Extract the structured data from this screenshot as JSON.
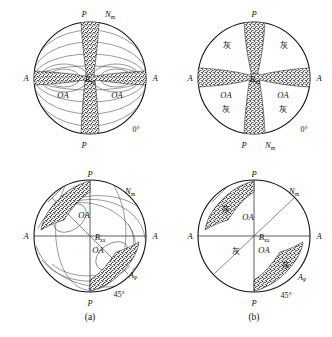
{
  "figure": {
    "captions": {
      "left": "(a)",
      "right": "(b)"
    }
  },
  "labels": {
    "P": "P",
    "A": "A",
    "OA": "OA",
    "Bxa_main": "B",
    "Bxa_sub": "xa",
    "Nm_main": "N",
    "Nm_sub": "m",
    "Ap_main": "A",
    "Ap_sub": "P",
    "gray_cjk": "灰",
    "angle_0": "0°",
    "angle_45": "45°"
  },
  "colors": {
    "outline": "#111111",
    "isochrome": "#555555",
    "brush": "#1a1a1a",
    "background": "#ffffff"
  },
  "panels": [
    {
      "id": "top-left",
      "name": "panel-a-0deg",
      "column": "a",
      "orientation": "0°",
      "has_isochromes": true,
      "has_gray_labels": false,
      "labels_shown": [
        "P",
        "N_m",
        "A",
        "A",
        "B_xa",
        "OA",
        "OA",
        "P",
        "0°"
      ]
    },
    {
      "id": "top-right",
      "name": "panel-b-0deg",
      "column": "b",
      "orientation": "0°",
      "has_isochromes": false,
      "has_gray_labels": true,
      "labels_shown": [
        "P",
        "A",
        "A",
        "B_xa",
        "OA",
        "OA",
        "灰",
        "灰",
        "灰",
        "灰",
        "P",
        "N_m",
        "0°"
      ]
    },
    {
      "id": "bottom-left",
      "name": "panel-a-45deg",
      "column": "a",
      "orientation": "45°",
      "has_isochromes": true,
      "has_gray_labels": false,
      "labels_shown": [
        "P",
        "N_m",
        "A",
        "A",
        "B_xa",
        "OA",
        "OA",
        "A_P",
        "P",
        "45°"
      ]
    },
    {
      "id": "bottom-right",
      "name": "panel-b-45deg",
      "column": "b",
      "orientation": "45°",
      "has_isochromes": false,
      "has_gray_labels": true,
      "labels_shown": [
        "P",
        "N_m",
        "A",
        "A",
        "B_xa",
        "OA",
        "OA",
        "灰",
        "灰",
        "灰",
        "A_P",
        "P",
        "45°"
      ]
    }
  ]
}
